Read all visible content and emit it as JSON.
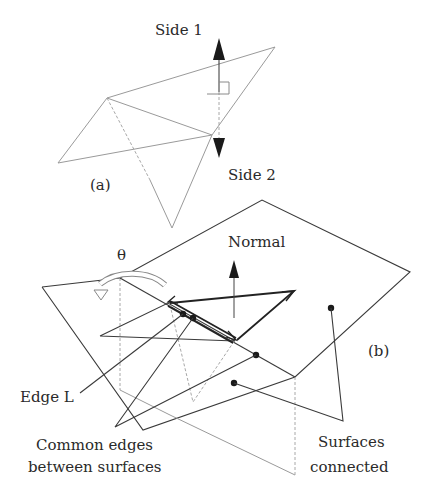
{
  "figure_a": {
    "panel_label": "(a)",
    "side1_label": "Side 1",
    "side2_label": "Side 2"
  },
  "figure_b": {
    "panel_label": "(b)",
    "theta_label": "θ",
    "normal_label": "Normal",
    "edge_label": "Edge L",
    "common_edges_line1": "Common edges",
    "common_edges_line2": "between surfaces",
    "surfaces_line1": "Surfaces",
    "surfaces_line2": "connected"
  },
  "colors": {
    "dark_stroke": "#3a3a3a",
    "light_stroke": "#9a9a9a",
    "text": "#2a2a2a"
  }
}
